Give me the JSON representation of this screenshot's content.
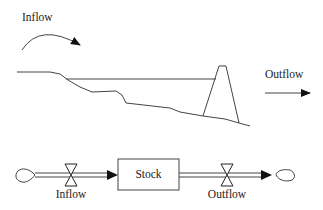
{
  "illustration": {
    "inflow_label": "Inflow",
    "outflow_label": "Outflow"
  },
  "stock_flow": {
    "stock_label": "Stock",
    "inflow_label": "Inflow",
    "outflow_label": "Outflow"
  },
  "colors": {
    "stroke": "#444444",
    "arrow_fill": "#111111",
    "text": "#222222",
    "background": "#ffffff"
  }
}
